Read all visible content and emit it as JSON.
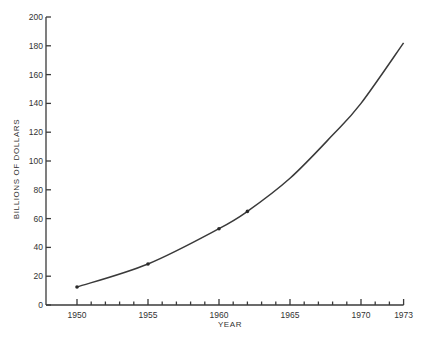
{
  "chart_data": {
    "type": "line",
    "title": "",
    "xlabel": "YEAR",
    "ylabel": "BILLIONS OF DOLLARS",
    "xlim": [
      1948,
      1973
    ],
    "ylim": [
      0,
      200
    ],
    "grid": false,
    "legend": null,
    "x_tick_labels": [
      "1950",
      "1955",
      "1960",
      "1965",
      "1970",
      "1973"
    ],
    "x_ticks": [
      1950,
      1955,
      1960,
      1965,
      1970,
      1973
    ],
    "x_minor_ticks_every": 1,
    "y_tick_labels": [
      "0",
      "20",
      "40",
      "60",
      "80",
      "100",
      "120",
      "140",
      "160",
      "180",
      "200"
    ],
    "y_ticks": [
      0,
      20,
      40,
      60,
      80,
      100,
      120,
      140,
      160,
      180,
      200
    ],
    "series": [
      {
        "name": "Billions of dollars",
        "x": [
          1950,
          1955,
          1960,
          1962,
          1965,
          1968,
          1970,
          1973
        ],
        "y": [
          12.5,
          28.5,
          53,
          65,
          88,
          118,
          140,
          182
        ],
        "markers_at": [
          1950,
          1955,
          1960,
          1962
        ]
      }
    ]
  }
}
